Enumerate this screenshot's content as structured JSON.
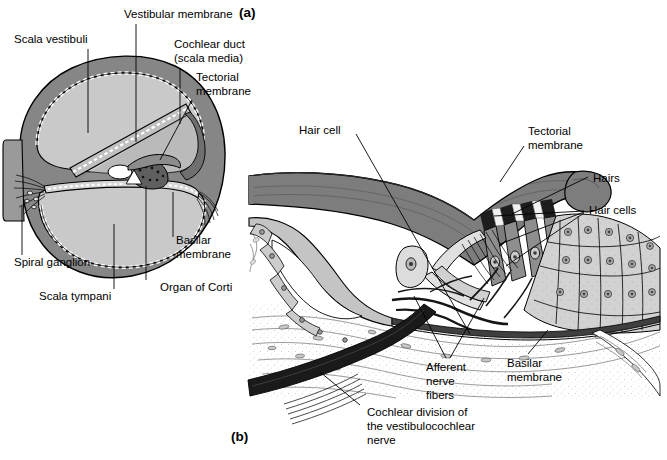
{
  "figure": {
    "title_visible": false,
    "panels": [
      {
        "tag": "(a)",
        "name": "cochlea-cross-section",
        "x": 239,
        "y": 13
      },
      {
        "tag": "(b)",
        "name": "organ-of-corti-detail",
        "x": 231,
        "y": 437
      }
    ]
  },
  "colors": {
    "background": "#ffffff",
    "ink": "#000000",
    "bone_gray": "#868686",
    "fluid_gray": "#c9c9c9",
    "membrane_gray": "#7d7d7d",
    "tissue_light": "#d7d7d7",
    "tissue_mid": "#b4b4b4",
    "nerve_dark": "#1a1a1a",
    "cell_fill": "#cfcfcf"
  },
  "panel_a": {
    "name": "cochlea-cross-section",
    "labels": [
      {
        "id": "scala-vestibuli",
        "text": "Scala vestibuli",
        "x": 14,
        "y": 40,
        "anchor": "start"
      },
      {
        "id": "vestibular-membrane",
        "text": "Vestibular membrane",
        "x": 124,
        "y": 15,
        "anchor": "start"
      },
      {
        "id": "cochlear-duct-line1",
        "text": "Cochlear duct",
        "x": 174,
        "y": 45,
        "anchor": "start"
      },
      {
        "id": "cochlear-duct-line2",
        "text": "(scala media)",
        "x": 174,
        "y": 59,
        "anchor": "start"
      },
      {
        "id": "tectorial-membrane-line1",
        "text": "Tectorial",
        "x": 196,
        "y": 78,
        "anchor": "start"
      },
      {
        "id": "tectorial-membrane-line2",
        "text": "membrane",
        "x": 196,
        "y": 92,
        "anchor": "start"
      },
      {
        "id": "spiral-ganglion",
        "text": "Spiral ganglion",
        "x": 14,
        "y": 263,
        "anchor": "start"
      },
      {
        "id": "scala-tympani",
        "text": "Scala tympani",
        "x": 39,
        "y": 297,
        "anchor": "start"
      },
      {
        "id": "basilar-membrane-line1",
        "text": "Basilar",
        "x": 176,
        "y": 241,
        "anchor": "start"
      },
      {
        "id": "basilar-membrane-line2",
        "text": "membrane",
        "x": 176,
        "y": 255,
        "anchor": "start"
      },
      {
        "id": "organ-of-corti",
        "text": "Organ of Corti",
        "x": 160,
        "y": 288,
        "anchor": "start"
      }
    ]
  },
  "panel_b": {
    "name": "organ-of-corti-detail",
    "labels": [
      {
        "id": "hair-cell",
        "text": "Hair cell",
        "x": 299,
        "y": 131,
        "anchor": "start"
      },
      {
        "id": "tectorial-membrane-line1",
        "text": "Tectorial",
        "x": 528,
        "y": 132,
        "anchor": "start"
      },
      {
        "id": "tectorial-membrane-line2",
        "text": "membrane",
        "x": 528,
        "y": 146,
        "anchor": "start"
      },
      {
        "id": "hairs",
        "text": "Hairs",
        "x": 593,
        "y": 179,
        "anchor": "start"
      },
      {
        "id": "hair-cells",
        "text": "Hair cells",
        "x": 589,
        "y": 211,
        "anchor": "start"
      },
      {
        "id": "afferent-nerve-fibers-line1",
        "text": "Afferent",
        "x": 426,
        "y": 368,
        "anchor": "start"
      },
      {
        "id": "afferent-nerve-fibers-line2",
        "text": "nerve",
        "x": 426,
        "y": 382,
        "anchor": "start"
      },
      {
        "id": "afferent-nerve-fibers-line3",
        "text": "fibers",
        "x": 426,
        "y": 396,
        "anchor": "start"
      },
      {
        "id": "basilar-membrane-line1",
        "text": "Basilar",
        "x": 507,
        "y": 364,
        "anchor": "start"
      },
      {
        "id": "basilar-membrane-line2",
        "text": "membrane",
        "x": 507,
        "y": 378,
        "anchor": "start"
      },
      {
        "id": "cochlear-division-line1",
        "text": "Cochlear division of",
        "x": 367,
        "y": 413,
        "anchor": "start"
      },
      {
        "id": "cochlear-division-line2",
        "text": "the vestibulocochlear",
        "x": 367,
        "y": 427,
        "anchor": "start"
      },
      {
        "id": "cochlear-division-line3",
        "text": "nerve",
        "x": 367,
        "y": 441,
        "anchor": "start"
      }
    ]
  }
}
